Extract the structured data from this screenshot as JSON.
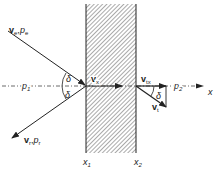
{
  "diagram": {
    "type": "wave transmission through slab",
    "incident": {
      "velocity": "v",
      "velocity_sub": "e",
      "pressure": "p",
      "pressure_sub": "e"
    },
    "reflected": {
      "velocity": "v",
      "velocity_sub": "r",
      "pressure": "p",
      "pressure_sub": "r"
    },
    "transmitted": {
      "velocity": "v",
      "velocity_sub": "t"
    },
    "inner_x_velocity": {
      "velocity": "v",
      "velocity_sub": "x"
    },
    "transmitted_x_velocity": {
      "velocity": "v",
      "velocity_sub": "tx"
    },
    "region1_pressure": {
      "p": "p",
      "sub": "1"
    },
    "region2_pressure": {
      "p": "p",
      "sub": "2"
    },
    "angle": "δ",
    "axis_label": "x",
    "boundary1": {
      "x": "x",
      "sub": "1"
    },
    "boundary2": {
      "x": "x",
      "sub": "2"
    },
    "colors": {
      "line": "#222222",
      "hatch": "#555555",
      "background": "#ffffff"
    }
  }
}
